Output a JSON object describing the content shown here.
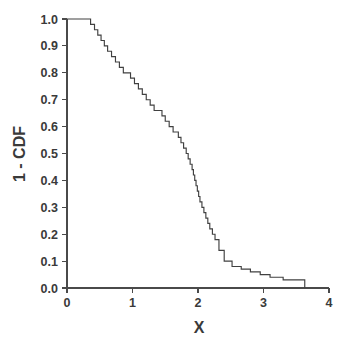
{
  "chart_data": {
    "type": "line",
    "subtype": "step-survival-function",
    "title": "",
    "subtitle": "",
    "xlabel": "X",
    "ylabel": "1 - CDF",
    "xlim": [
      0,
      4
    ],
    "ylim": [
      0.0,
      1.0
    ],
    "xticks": [
      0,
      1,
      2,
      3,
      4
    ],
    "xtick_labels": [
      "0",
      "1",
      "2",
      "3",
      "4"
    ],
    "yticks": [
      0.0,
      0.1,
      0.2,
      0.3,
      0.4,
      0.5,
      0.6,
      0.7,
      0.8,
      0.9,
      1.0
    ],
    "ytick_labels": [
      "0.0",
      "0.1",
      "0.2",
      "0.3",
      "0.4",
      "0.5",
      "0.6",
      "0.7",
      "0.8",
      "0.9",
      "1.0"
    ],
    "grid": false,
    "legend": null,
    "legend_position": "none",
    "series": [
      {
        "name": "1 - CDF",
        "color": "#404040",
        "step_type": "post",
        "x": [
          0.0,
          0.3,
          0.36,
          0.42,
          0.47,
          0.52,
          0.57,
          0.62,
          0.68,
          0.74,
          0.8,
          0.86,
          0.9,
          0.97,
          1.03,
          1.09,
          1.15,
          1.21,
          1.27,
          1.33,
          1.39,
          1.45,
          1.5,
          1.56,
          1.62,
          1.66,
          1.7,
          1.74,
          1.78,
          1.82,
          1.85,
          1.88,
          1.91,
          1.93,
          1.95,
          1.97,
          1.99,
          2.01,
          2.03,
          2.06,
          2.09,
          2.12,
          2.15,
          2.18,
          2.22,
          2.26,
          2.32,
          2.4,
          2.52,
          2.66,
          2.8,
          2.95,
          3.1,
          3.3,
          3.5,
          3.63
        ],
        "y": [
          1.0,
          1.0,
          0.98,
          0.96,
          0.94,
          0.92,
          0.9,
          0.88,
          0.86,
          0.84,
          0.82,
          0.8,
          0.8,
          0.78,
          0.76,
          0.74,
          0.72,
          0.7,
          0.68,
          0.66,
          0.66,
          0.64,
          0.62,
          0.6,
          0.58,
          0.58,
          0.56,
          0.54,
          0.52,
          0.5,
          0.48,
          0.46,
          0.44,
          0.42,
          0.4,
          0.38,
          0.36,
          0.34,
          0.32,
          0.3,
          0.28,
          0.26,
          0.24,
          0.22,
          0.2,
          0.18,
          0.14,
          0.1,
          0.08,
          0.07,
          0.06,
          0.05,
          0.04,
          0.03,
          0.03,
          0.0
        ]
      }
    ],
    "annotations": []
  },
  "axes": {
    "x_title": "X",
    "y_title": "1 - CDF"
  },
  "colors": {
    "line": "#404040",
    "axis": "#4a4a4a",
    "text": "#3a3a3a",
    "background": "#ffffff"
  }
}
